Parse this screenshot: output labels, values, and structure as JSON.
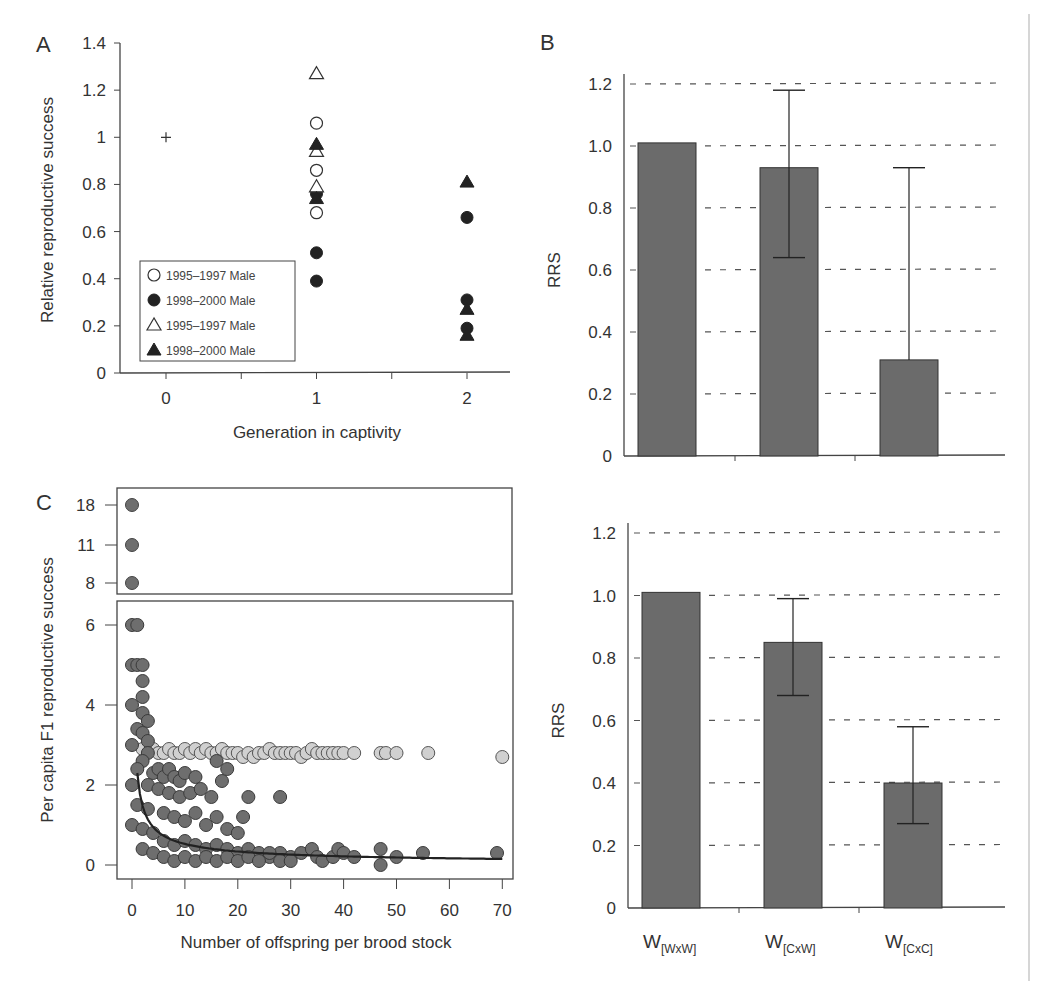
{
  "chart_data": [
    {
      "panel": "A",
      "type": "scatter",
      "title": "",
      "xlabel": "Generation in captivity",
      "ylabel": "Relative reproductive success",
      "xticks": [
        "0",
        "1",
        "2"
      ],
      "yticks": [
        "0",
        "0.2",
        "0.4",
        "0.6",
        "0.8",
        "1",
        "1.2",
        "1.4"
      ],
      "ylim": [
        0,
        1.4
      ],
      "xlim": [
        -0.3,
        2.3
      ],
      "grid": false,
      "legend_position": "lower-left inside",
      "reference_point": {
        "x": 0,
        "y": 1.0,
        "marker": "plus"
      },
      "series": [
        {
          "name": "1995-1997 Male",
          "marker": "open-circle",
          "x": [
            1,
            1,
            1
          ],
          "y": [
            1.06,
            0.86,
            0.68
          ]
        },
        {
          "name": "1998-2000 Male",
          "marker": "filled-circle",
          "x": [
            1,
            1,
            1,
            2,
            2,
            2
          ],
          "y": [
            0.76,
            0.51,
            0.39,
            0.66,
            0.31,
            0.19
          ]
        },
        {
          "name": "1995-1997 Male",
          "marker": "open-triangle",
          "x": [
            1,
            1,
            1
          ],
          "y": [
            1.27,
            0.94,
            0.79
          ]
        },
        {
          "name": "1998-2000 Male",
          "marker": "filled-triangle",
          "x": [
            1,
            1,
            2,
            2,
            2
          ],
          "y": [
            0.97,
            0.74,
            0.81,
            0.27,
            0.16
          ]
        }
      ]
    },
    {
      "panel": "B-top",
      "type": "bar",
      "title": "",
      "xlabel": "",
      "ylabel": "RRS",
      "categories": [
        "W[WxW]",
        "W[CxW]",
        "W[CxC]"
      ],
      "values": [
        1.01,
        0.93,
        0.31
      ],
      "error_low": [
        null,
        0.64,
        null
      ],
      "error_high": [
        null,
        1.18,
        0.93
      ],
      "yticks": [
        "0",
        "0.2",
        "0.4",
        "0.6",
        "0.8",
        "1.0",
        "1.2"
      ],
      "ylim": [
        0,
        1.2
      ],
      "grid": "dashed horizontal"
    },
    {
      "panel": "B-bottom",
      "type": "bar",
      "title": "",
      "xlabel": "",
      "ylabel": "RRS",
      "categories": [
        "W[WxW]",
        "W[CxW]",
        "W[CxC]"
      ],
      "values": [
        1.01,
        0.85,
        0.4
      ],
      "error_low": [
        null,
        0.68,
        0.27
      ],
      "error_high": [
        null,
        0.99,
        0.58
      ],
      "yticks": [
        "0",
        "0.2",
        "0.4",
        "0.6",
        "0.8",
        "1.0",
        "1.2"
      ],
      "ylim": [
        0,
        1.2
      ],
      "grid": "dashed horizontal"
    },
    {
      "panel": "C",
      "type": "scatter",
      "title": "",
      "xlabel": "Number of offspring per brood stock",
      "ylabel": "Per capita F1 reproductive success",
      "xticks": [
        "0",
        "10",
        "20",
        "30",
        "40",
        "50",
        "60",
        "70"
      ],
      "yticks_lower": [
        "0",
        "2",
        "4",
        "6"
      ],
      "yticks_upper": [
        "8",
        "11",
        "18"
      ],
      "xlim": [
        0,
        70
      ],
      "ylim_lower": [
        0,
        6.5
      ],
      "broken_axis": true,
      "upper_points": [
        {
          "x": 0,
          "y": 18
        },
        {
          "x": 0,
          "y": 11
        },
        {
          "x": 0,
          "y": 8
        }
      ],
      "series": [
        {
          "name": "dark points",
          "color": "#6e6e6e",
          "points": [
            [
              0,
              6
            ],
            [
              1,
              6
            ],
            [
              0,
              5
            ],
            [
              1,
              5
            ],
            [
              2,
              5
            ],
            [
              2,
              4.6
            ],
            [
              2,
              4.2
            ],
            [
              0,
              4
            ],
            [
              2,
              3.8
            ],
            [
              3,
              3.6
            ],
            [
              1,
              3.4
            ],
            [
              2,
              3.3
            ],
            [
              3,
              3.1
            ],
            [
              0,
              3
            ],
            [
              3,
              2.8
            ],
            [
              2,
              2.6
            ],
            [
              1,
              2.4
            ],
            [
              4,
              2.3
            ],
            [
              5,
              2.4
            ],
            [
              6,
              2.2
            ],
            [
              7,
              2.4
            ],
            [
              8,
              2.2
            ],
            [
              9,
              2.1
            ],
            [
              10,
              2.3
            ],
            [
              12,
              2.2
            ],
            [
              0,
              2
            ],
            [
              3,
              2
            ],
            [
              5,
              1.9
            ],
            [
              7,
              1.8
            ],
            [
              9,
              1.7
            ],
            [
              11,
              1.8
            ],
            [
              13,
              1.9
            ],
            [
              15,
              1.7
            ],
            [
              16,
              2.6
            ],
            [
              17,
              2.1
            ],
            [
              18,
              2.4
            ],
            [
              22,
              1.7
            ],
            [
              28,
              1.7
            ],
            [
              1,
              1.5
            ],
            [
              3,
              1.4
            ],
            [
              6,
              1.3
            ],
            [
              8,
              1.2
            ],
            [
              10,
              1.1
            ],
            [
              12,
              1.3
            ],
            [
              14,
              1.0
            ],
            [
              16,
              1.2
            ],
            [
              18,
              0.9
            ],
            [
              20,
              0.8
            ],
            [
              21,
              1.2
            ],
            [
              0,
              1
            ],
            [
              2,
              0.9
            ],
            [
              4,
              0.8
            ],
            [
              6,
              0.6
            ],
            [
              8,
              0.5
            ],
            [
              10,
              0.6
            ],
            [
              12,
              0.5
            ],
            [
              14,
              0.4
            ],
            [
              16,
              0.5
            ],
            [
              18,
              0.4
            ],
            [
              20,
              0.3
            ],
            [
              22,
              0.4
            ],
            [
              24,
              0.3
            ],
            [
              26,
              0.2
            ],
            [
              28,
              0.3
            ],
            [
              30,
              0.2
            ],
            [
              32,
              0.3
            ],
            [
              34,
              0.4
            ],
            [
              35,
              0.2
            ],
            [
              36,
              0.1
            ],
            [
              38,
              0.2
            ],
            [
              39,
              0.4
            ],
            [
              40,
              0.3
            ],
            [
              42,
              0.2
            ],
            [
              2,
              0.4
            ],
            [
              4,
              0.3
            ],
            [
              6,
              0.2
            ],
            [
              8,
              0.1
            ],
            [
              10,
              0.2
            ],
            [
              12,
              0.1
            ],
            [
              14,
              0.2
            ],
            [
              16,
              0.1
            ],
            [
              18,
              0.2
            ],
            [
              20,
              0.1
            ],
            [
              22,
              0.2
            ],
            [
              24,
              0.1
            ],
            [
              26,
              0.3
            ],
            [
              28,
              0.1
            ],
            [
              30,
              0.1
            ],
            [
              47,
              0.4
            ],
            [
              47,
              0
            ],
            [
              50,
              0.2
            ],
            [
              55,
              0.3
            ],
            [
              69,
              0.3
            ]
          ]
        },
        {
          "name": "light points",
          "color": "#d0d0d0",
          "points": [
            [
              2,
              2.9
            ],
            [
              4,
              2.9
            ],
            [
              5,
              2.8
            ],
            [
              6,
              2.8
            ],
            [
              7,
              2.9
            ],
            [
              8,
              2.8
            ],
            [
              9,
              2.8
            ],
            [
              10,
              2.9
            ],
            [
              11,
              2.8
            ],
            [
              12,
              2.9
            ],
            [
              13,
              2.8
            ],
            [
              14,
              2.9
            ],
            [
              15,
              2.8
            ],
            [
              16,
              2.8
            ],
            [
              17,
              2.9
            ],
            [
              18,
              2.8
            ],
            [
              19,
              2.8
            ],
            [
              20,
              2.8
            ],
            [
              21,
              2.7
            ],
            [
              22,
              2.8
            ],
            [
              23,
              2.7
            ],
            [
              24,
              2.8
            ],
            [
              25,
              2.8
            ],
            [
              26,
              2.9
            ],
            [
              27,
              2.8
            ],
            [
              28,
              2.8
            ],
            [
              29,
              2.8
            ],
            [
              30,
              2.8
            ],
            [
              31,
              2.8
            ],
            [
              32,
              2.7
            ],
            [
              33,
              2.8
            ],
            [
              34,
              2.9
            ],
            [
              35,
              2.8
            ],
            [
              36,
              2.8
            ],
            [
              37,
              2.8
            ],
            [
              38,
              2.8
            ],
            [
              39,
              2.8
            ],
            [
              40,
              2.8
            ],
            [
              42,
              2.8
            ],
            [
              47,
              2.8
            ],
            [
              48,
              2.8
            ],
            [
              50,
              2.8
            ],
            [
              56,
              2.8
            ],
            [
              70,
              2.7
            ]
          ]
        }
      ],
      "fit_curve": "decreasing power curve from (1,2.3) to (70,0.15)"
    }
  ],
  "labels": {
    "panel_a": "A",
    "panel_b": "B",
    "panel_c": "C"
  }
}
